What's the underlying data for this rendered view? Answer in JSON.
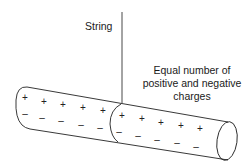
{
  "diagram": {
    "string_label": "String",
    "charges_label": {
      "line1": "Equal number of",
      "line2": "positive and negative",
      "line3": "charges"
    },
    "rod": {
      "segments": [
        {
          "name": "left-segment",
          "positive_symbols": [
            "+",
            "+",
            "+",
            "+",
            "+"
          ],
          "negative_symbols": [
            "–",
            "–",
            "–",
            "–",
            "–"
          ]
        },
        {
          "name": "right-segment",
          "positive_symbols": [
            "+",
            "+",
            "+",
            "+",
            "+"
          ],
          "negative_symbols": [
            "–",
            "–",
            "–",
            "–",
            "–"
          ]
        }
      ]
    },
    "colors": {
      "stroke": "#222222",
      "text": "#1a1a1a",
      "background": "#ffffff"
    }
  }
}
